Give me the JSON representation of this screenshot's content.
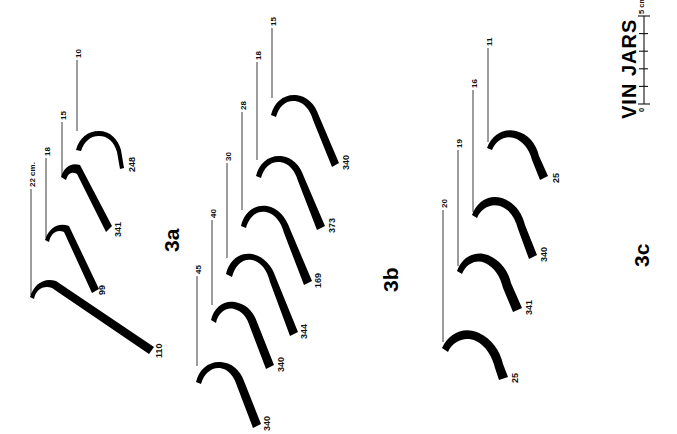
{
  "figure": {
    "title": "VIN JARS",
    "scale": {
      "min_label": "0",
      "max_label": "5 cm.",
      "ticks": 5,
      "unit": "cm"
    },
    "orientation_note": "rotated-90",
    "ink_color": "#000000",
    "background_color": "#ffffff",
    "leader_color": "#3a3a3a"
  },
  "groups": [
    {
      "id": "3a",
      "label": "3a",
      "profiles": [
        {
          "diameter": "10",
          "catalog_id": "248"
        },
        {
          "diameter": "15",
          "catalog_id": "341"
        },
        {
          "diameter": "18",
          "catalog_id": "99"
        },
        {
          "diameter": "22 cm.",
          "catalog_id": "110"
        }
      ]
    },
    {
      "id": "3b",
      "label": "3b",
      "profiles": [
        {
          "diameter": "15",
          "catalog_id": "340"
        },
        {
          "diameter": "18",
          "catalog_id": "373"
        },
        {
          "diameter": "28",
          "catalog_id": "169"
        },
        {
          "diameter": "30",
          "catalog_id": "344"
        },
        {
          "diameter": "40",
          "catalog_id": "340"
        },
        {
          "diameter": "45",
          "catalog_id": "340"
        }
      ]
    },
    {
      "id": "3c",
      "label": "3c",
      "profiles": [
        {
          "diameter": "11",
          "catalog_id": "25"
        },
        {
          "diameter": "16",
          "catalog_id": "340"
        },
        {
          "diameter": "19",
          "catalog_id": "341"
        },
        {
          "diameter": "20",
          "catalog_id": "25"
        }
      ]
    }
  ]
}
